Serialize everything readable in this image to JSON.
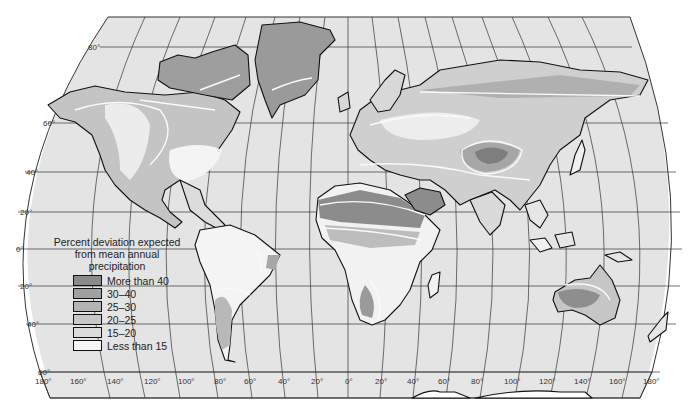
{
  "map": {
    "title": "Percent deviation expected from mean annual precipitation",
    "projection": "world, pseudo-cylindrical with curved meridians",
    "latitude_labels": [
      "80°",
      "60°",
      "40°",
      "20°",
      "0°",
      "20°",
      "40°",
      "60°"
    ],
    "longitude_labels": [
      "180°",
      "160°",
      "140°",
      "120°",
      "100°",
      "80°",
      "60°",
      "40°",
      "20°",
      "0°",
      "20°",
      "40°",
      "60°",
      "80°",
      "100°",
      "120°",
      "140°",
      "160°",
      "180°"
    ]
  },
  "legend": {
    "title_lines": [
      "Percent deviation expected",
      "from mean annual",
      "precipitation"
    ],
    "items": [
      {
        "label": "More than 40",
        "color": "#8a8a8a"
      },
      {
        "label": "30–40",
        "color": "#a0a0a0"
      },
      {
        "label": "25–30",
        "color": "#b4b4b4"
      },
      {
        "label": "20–25",
        "color": "#c8c8c8"
      },
      {
        "label": "15–20",
        "color": "#dcdcdc"
      },
      {
        "label": "Less than 15",
        "color": "#f6f6f6"
      }
    ]
  },
  "colors": {
    "ocean": "#e4e4e4",
    "outline": "#111111",
    "isoline": "#fafafa"
  }
}
